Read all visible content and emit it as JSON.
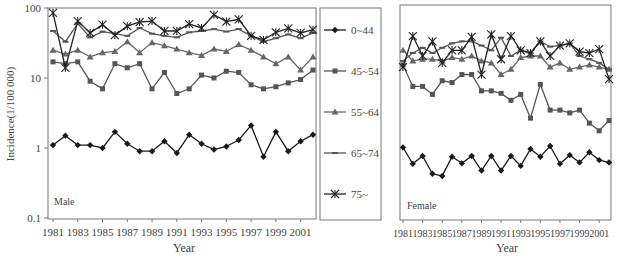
{
  "chart_data": [
    {
      "type": "line",
      "title": "Male",
      "xlabel": "Year",
      "ylabel": "Incidence(1/100 000)",
      "yscale": "log",
      "ylim": [
        0.1,
        100
      ],
      "yticks": [
        "0.1",
        "1",
        "10",
        "100"
      ],
      "xtick_labels": [
        "1981",
        "1983",
        "1985",
        "1987",
        "1989",
        "1991",
        "1993",
        "1995",
        "1997",
        "1999",
        "2001"
      ],
      "x": [
        1981,
        1982,
        1983,
        1984,
        1985,
        1986,
        1987,
        1988,
        1989,
        1990,
        1991,
        1992,
        1993,
        1994,
        1995,
        1996,
        1997,
        1998,
        1999,
        2000,
        2001,
        2002
      ],
      "series": [
        {
          "name": "0~44",
          "marker": "diamond",
          "values": [
            1.1,
            1.5,
            1.1,
            1.1,
            1.0,
            1.7,
            1.15,
            0.9,
            0.9,
            1.25,
            0.85,
            1.55,
            1.15,
            0.95,
            1.05,
            1.3,
            2.1,
            0.75,
            1.7,
            0.9,
            1.25,
            1.55
          ]
        },
        {
          "name": "45~54",
          "marker": "square",
          "values": [
            17,
            16,
            17,
            9,
            7,
            16,
            14,
            16,
            7,
            12,
            6,
            7,
            11,
            10,
            12.5,
            12,
            8,
            7,
            7.5,
            8.5,
            9.5,
            13
          ]
        },
        {
          "name": "55~64",
          "marker": "triangle",
          "values": [
            25,
            22,
            25,
            20,
            23,
            24,
            33,
            23,
            32,
            29,
            26,
            23,
            21,
            26,
            24,
            30,
            25,
            20,
            16,
            20,
            13,
            20
          ]
        },
        {
          "name": "65~74",
          "marker": "dash",
          "values": [
            47,
            33,
            60,
            38,
            46,
            43,
            40,
            52,
            43,
            40,
            38,
            45,
            47,
            50,
            46,
            50,
            40,
            33,
            37,
            42,
            37,
            44
          ]
        },
        {
          "name": "75~",
          "marker": "star",
          "values": [
            85,
            14,
            65,
            44,
            58,
            41,
            55,
            63,
            65,
            47,
            47,
            59,
            52,
            80,
            64,
            69,
            40,
            35,
            45,
            51,
            44,
            49
          ]
        }
      ]
    },
    {
      "type": "line",
      "title": "Female",
      "xlabel": "Year",
      "yscale": "log",
      "ylim": [
        0.1,
        100
      ],
      "xtick_labels": [
        "1981",
        "1983",
        "1985",
        "1987",
        "1989",
        "1991",
        "1993",
        "1995",
        "1997",
        "1999",
        "2001"
      ],
      "x": [
        1981,
        1982,
        1983,
        1984,
        1985,
        1986,
        1987,
        1988,
        1989,
        1990,
        1991,
        1992,
        1993,
        1994,
        1995,
        1996,
        1997,
        1998,
        1999,
        2000,
        2001,
        2002
      ],
      "series": [
        {
          "name": "0~44",
          "marker": "diamond",
          "values": [
            1.05,
            0.62,
            0.8,
            0.45,
            0.42,
            0.78,
            0.63,
            0.8,
            0.5,
            0.8,
            0.5,
            0.8,
            0.58,
            1.0,
            0.78,
            1.1,
            0.62,
            0.82,
            0.65,
            0.9,
            0.7,
            0.65
          ]
        },
        {
          "name": "45~54",
          "marker": "square",
          "values": [
            15,
            7.5,
            7.5,
            5.8,
            9,
            8.5,
            11,
            11,
            6.5,
            6.5,
            6,
            4.8,
            5.8,
            2.7,
            8,
            3.5,
            3.5,
            3.2,
            3.5,
            2.3,
            1.8,
            2.5
          ]
        },
        {
          "name": "55~64",
          "marker": "triangle",
          "values": [
            24,
            17,
            18,
            18,
            17,
            19,
            18,
            20,
            17,
            16,
            11,
            13,
            19,
            20,
            20,
            14,
            16,
            13,
            14,
            15,
            14,
            13
          ]
        },
        {
          "name": "65~74",
          "marker": "dash",
          "values": [
            17,
            22,
            26,
            22,
            26,
            30,
            32,
            32,
            28,
            24,
            36,
            20,
            24,
            22,
            32,
            27,
            28,
            30,
            20,
            18,
            16,
            13
          ]
        },
        {
          "name": "75~",
          "marker": "star",
          "values": [
            14,
            38,
            20,
            32,
            16,
            24,
            24,
            37,
            11,
            40,
            18,
            38,
            24,
            22,
            32,
            20,
            28,
            30,
            23,
            22,
            25,
            9.5
          ]
        }
      ]
    }
  ],
  "male": {
    "label": "Male",
    "xlabel": "Year",
    "ylabel": "Incidence(1/100 000)",
    "yticks": [
      {
        "v": 100,
        "label": "100"
      },
      {
        "v": 10,
        "label": "10"
      },
      {
        "v": 1,
        "label": "1"
      },
      {
        "v": 0.1,
        "label": "0.1"
      }
    ]
  },
  "female": {
    "label": "Female",
    "xlabel": "Year"
  },
  "legend": {
    "items": [
      "0~44",
      "45~54",
      "55~64",
      "65~74",
      "75~"
    ]
  },
  "colors": {
    "0~44": "#1a1a1a",
    "45~54": "#555555",
    "55~64": "#666666",
    "65~74": "#555555",
    "75~": "#222222",
    "axis": "#777777"
  }
}
